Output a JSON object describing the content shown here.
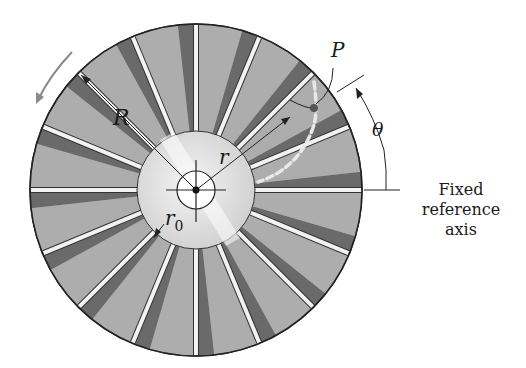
{
  "figure": {
    "type": "rotating disk with radial vanes (impeller)",
    "center": {
      "x": 196,
      "y": 190
    },
    "outer_radius": 166,
    "hub_radius": 59,
    "inner_circle_radius": 19,
    "vane_count": 16,
    "colors": {
      "disk_dark": "#5a5a5a",
      "disk_mid": "#8c8c8c",
      "disk_light": "#bdbdbd",
      "hub_light": "#e8e8e8",
      "vane": "#f2f2f2",
      "outline": "#222222",
      "rotation_arrow": "#8a8a8a",
      "point_p": "#555555"
    }
  },
  "labels": {
    "outer_radius": "R",
    "radial_position": "r",
    "hub_radius_sub_base": "r",
    "hub_radius_sub": "0",
    "point": "P",
    "angle": "θ",
    "reference_axis_line1": "Fixed",
    "reference_axis_line2": "reference",
    "reference_axis_line3": "axis"
  }
}
